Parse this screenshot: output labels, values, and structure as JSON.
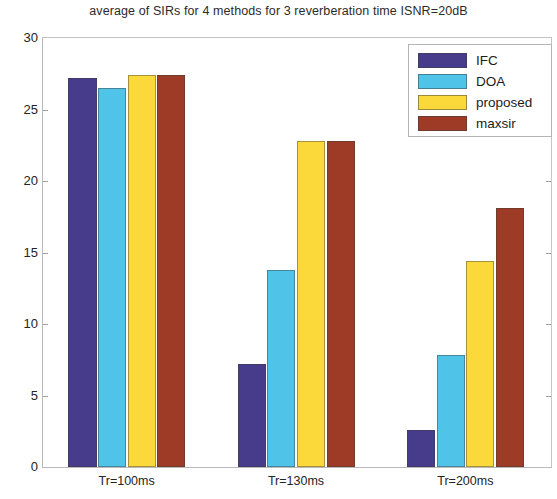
{
  "chart_data": {
    "type": "bar",
    "title": "average of SIRs for 4 methods for 3 reverberation time ISNR=20dB",
    "xlabel": "",
    "ylabel": "",
    "categories": [
      "Tr=100ms",
      "Tr=130ms",
      "Tr=200ms"
    ],
    "series": [
      {
        "name": "IFC",
        "color": "#473c8b",
        "values": [
          27.2,
          7.2,
          2.6
        ]
      },
      {
        "name": "DOA",
        "color": "#4fc3e8",
        "values": [
          26.5,
          13.8,
          7.8
        ]
      },
      {
        "name": "proposed",
        "color": "#fcd93b",
        "values": [
          27.4,
          22.8,
          14.4
        ]
      },
      {
        "name": "maxsir",
        "color": "#9e3b26",
        "values": [
          27.4,
          22.8,
          18.1
        ]
      }
    ],
    "ylim": [
      0,
      30
    ],
    "yticks": [
      0,
      5,
      10,
      15,
      20,
      25,
      30
    ],
    "ytick_labels": [
      "0",
      "5",
      "10",
      "15",
      "20",
      "25",
      "30"
    ],
    "grid": false,
    "legend_position": "top-right",
    "legend_entries": [
      "IFC",
      "DOA",
      "proposed",
      "maxsir"
    ]
  }
}
